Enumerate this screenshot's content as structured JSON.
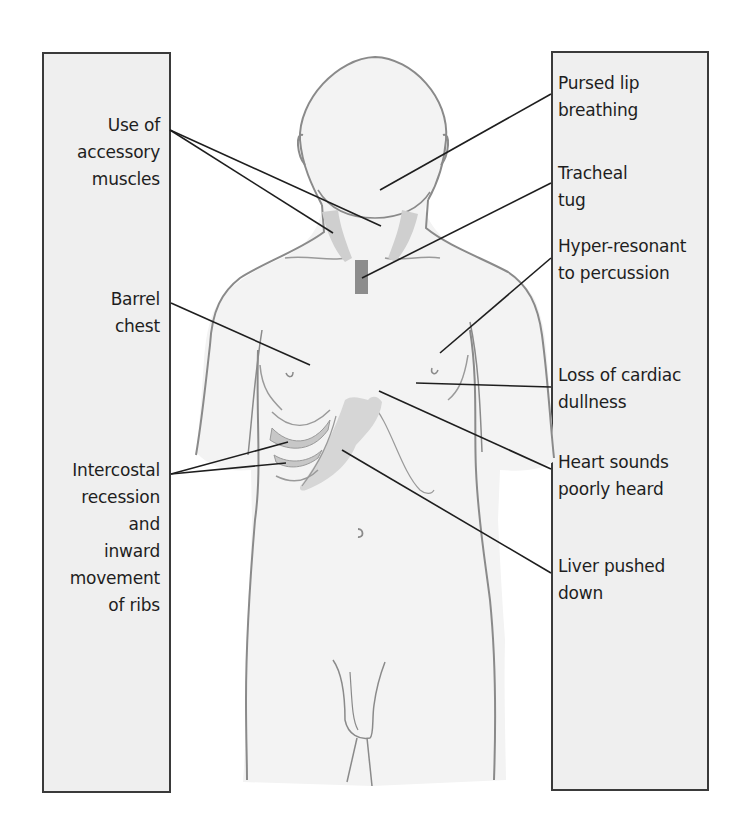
{
  "diagram": {
    "colors": {
      "background": "#ffffff",
      "box_fill": "#efefef",
      "box_border": "#3a3a3a",
      "body_fill": "#f3f3f3",
      "body_outline": "#8a8a8a",
      "muscle_shade": "#cfcfcf",
      "trachea_shade": "#8c8c8c",
      "leader_line": "#1e1e1e"
    },
    "left_labels": [
      {
        "id": "accessory-muscles",
        "text": "Use of\naccessory\nmuscles"
      },
      {
        "id": "barrel-chest",
        "text": "Barrel\nchest"
      },
      {
        "id": "intercostal-recession",
        "text": "Intercostal\nrecession\nand\ninward\nmovement\nof ribs"
      }
    ],
    "right_labels": [
      {
        "id": "pursed-lip",
        "text": "Pursed lip\nbreathing"
      },
      {
        "id": "tracheal-tug",
        "text": "Tracheal\ntug"
      },
      {
        "id": "hyper-resonant",
        "text": "Hyper-resonant\nto percussion"
      },
      {
        "id": "cardiac-dullness",
        "text": "Loss of cardiac\ndullness"
      },
      {
        "id": "heart-sounds",
        "text": "Heart sounds\npoorly heard"
      },
      {
        "id": "liver",
        "text": "Liver pushed\ndown"
      }
    ]
  }
}
